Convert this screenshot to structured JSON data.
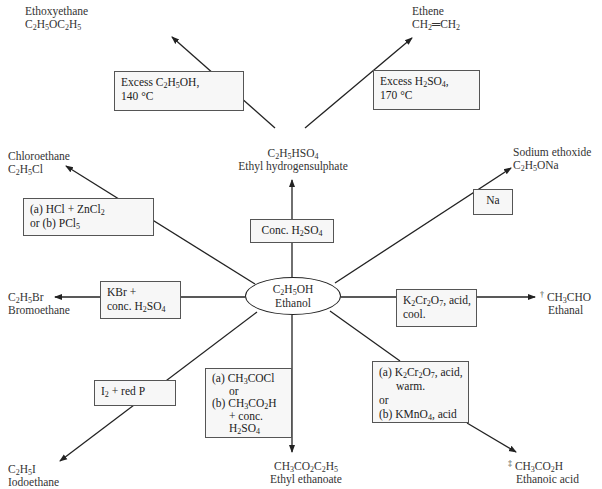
{
  "center": {
    "formula": "C2H5OH",
    "name": "Ethanol"
  },
  "products": {
    "ethoxyethane": {
      "name": "Ethoxyethane",
      "formula": "C2H5OC2H5"
    },
    "ethene": {
      "name": "Ethene",
      "formula": "CH2=CH2"
    },
    "ethyl_hydrogensulphate": {
      "formula": "C2H5HSO4",
      "name": "Ethyl hydrogensulphate"
    },
    "chloroethane": {
      "name": "Chloroethane",
      "formula": "C2H5Cl"
    },
    "sodium_ethoxide": {
      "name": "Sodium ethoxide",
      "formula": "C2H5ONa"
    },
    "bromoethane": {
      "formula": "C2H5Br",
      "name": "Bromoethane"
    },
    "ethanal": {
      "mark": "†",
      "formula": "CH3CHO",
      "name": "Ethanal"
    },
    "iodoethane": {
      "formula": "C2H5I",
      "name": "Iodoethane"
    },
    "ethyl_ethanoate": {
      "formula": "CH3CO2C2H5",
      "name": "Ethyl ethanoate"
    },
    "ethanoic_acid": {
      "mark": "‡",
      "formula": "CH3CO2H",
      "name": "Ethanoic acid"
    }
  },
  "conditions": {
    "ether": {
      "line1": "Excess C2H5OH,",
      "line2": "140 °C"
    },
    "ethene": {
      "line1": "Excess H2SO4,",
      "line2": "170 °C"
    },
    "sulphate": {
      "line1": "Conc. H2SO4"
    },
    "chloro": {
      "line1": "(a) HCl + ZnCl2",
      "line2": "or (b) PCl5"
    },
    "sodium": {
      "line1": "Na"
    },
    "bromo": {
      "line1": "KBr +",
      "line2": "conc. H2SO4"
    },
    "ethanal": {
      "line1": "K2Cr2O7, acid,",
      "line2": "cool."
    },
    "iodo": {
      "line1": "I2 + red P"
    },
    "ester": {
      "line1": "(a) CH3COCl",
      "line2": "or",
      "line3": "(b) CH3CO2H",
      "line4": "+ conc.",
      "line5": "H2SO4"
    },
    "acid": {
      "line1": "(a) K2Cr2O7, acid,",
      "line2": "warm.",
      "line3": "or",
      "line4": "(b) KMnO4, acid"
    }
  },
  "colors": {
    "line": "#222222",
    "box_fill": "#f7f7f7",
    "box_border": "#555555",
    "text": "#2a2a2a"
  }
}
